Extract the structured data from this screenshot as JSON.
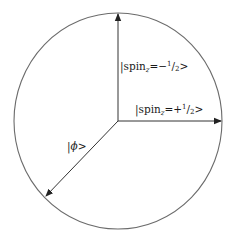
{
  "diagram": {
    "title": "",
    "circle": {
      "cx": 118,
      "cy": 121,
      "rx": 104,
      "ry": 108,
      "stroke": "#6b6b6b"
    },
    "arrows": [
      {
        "name": "spin-z-minus-half-arrow",
        "from": [
          118,
          121
        ],
        "to": [
          118,
          14
        ],
        "color": "#333333"
      },
      {
        "name": "spin-z-plus-half-arrow",
        "from": [
          118,
          121
        ],
        "to": [
          221,
          121
        ],
        "color": "#333333"
      },
      {
        "name": "phi-arrow",
        "from": [
          118,
          121
        ],
        "to": [
          46,
          196
        ],
        "color": "#333333"
      }
    ],
    "labels": {
      "spin_minus": {
        "prefix": "|spin",
        "subscript": "z",
        "eq": "=−",
        "num": "1",
        "slash": "/",
        "den": "2",
        "suffix": ">"
      },
      "spin_plus": {
        "prefix": "|spin",
        "subscript": "z",
        "eq": "=+",
        "num": "1",
        "slash": "/",
        "den": "2",
        "suffix": ">"
      },
      "phi": {
        "prefix": "|",
        "symbol": "ϕ",
        "suffix": ">"
      }
    }
  }
}
